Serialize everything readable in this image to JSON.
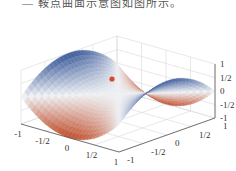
{
  "caption": "— 鞍点曲面示意图如图所示。",
  "chart_data": {
    "type": "surface3d",
    "title": "",
    "function": "z = x^2 - y^2",
    "x_range": [
      -1,
      1
    ],
    "y_range": [
      -1,
      1
    ],
    "z_range": [
      -1,
      1
    ],
    "x_ticks": [
      "-1",
      "-1/2",
      "0",
      "1/2",
      "1"
    ],
    "y_ticks": [
      "-1",
      "-1/2",
      "0",
      "1/2",
      "1"
    ],
    "z_ticks": [
      "1",
      "1/2",
      "0",
      "-1/2",
      "-1"
    ],
    "colormap": {
      "high": "#3b5a9a",
      "mid": "#eef0f3",
      "low": "#c1502e"
    },
    "marked_point": {
      "x": 0,
      "y": 0,
      "z": 0,
      "label": "saddle point",
      "color": "#d9462b"
    },
    "grid": true
  }
}
